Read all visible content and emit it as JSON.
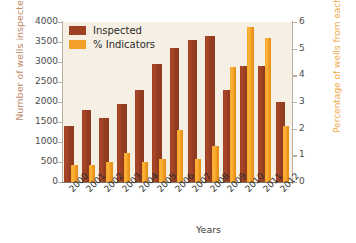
{
  "chart_data": {
    "type": "bar",
    "title": "",
    "categories": [
      "2000",
      "2001",
      "2002",
      "2003",
      "2004",
      "2005",
      "2006",
      "2007",
      "2008",
      "2009",
      "2010",
      "2011",
      "2012"
    ],
    "series": [
      {
        "name": "Inspected",
        "axis": "left",
        "color": "#9d4122",
        "values": [
          1400,
          1800,
          1600,
          1950,
          2300,
          2950,
          3350,
          3550,
          3650,
          2300,
          2900,
          2900,
          2000
        ]
      },
      {
        "name": "% Indicators",
        "axis": "right",
        "color": "#f2a02a",
        "values": [
          0.65,
          0.65,
          0.75,
          1.1,
          0.75,
          0.85,
          1.95,
          0.85,
          1.35,
          4.3,
          5.8,
          5.4,
          2.1
        ]
      }
    ],
    "xlabel": "Years",
    "ylabel": "Number of wells inspected",
    "ylabel_right": "Percentage of wells from each year with integrity issues",
    "ylim": [
      0,
      4000
    ],
    "ylim_right": [
      0,
      6
    ],
    "yticks": [
      "0",
      "500",
      "1000",
      "1500",
      "2000",
      "2500",
      "3000",
      "3500",
      "4000"
    ],
    "yticks_right": [
      "0",
      "1",
      "2",
      "3",
      "4",
      "5",
      "6"
    ],
    "grid": false,
    "legend_position": "top-left",
    "plot_background": "#f6f0e4",
    "left_axis_label_color": "#c08a6a",
    "right_axis_label_color": "#f0a94a"
  },
  "legend": {
    "items": [
      {
        "label": "Inspected",
        "color": "#9d4122"
      },
      {
        "label": "% Indicators",
        "color": "#f2a02a"
      }
    ]
  }
}
